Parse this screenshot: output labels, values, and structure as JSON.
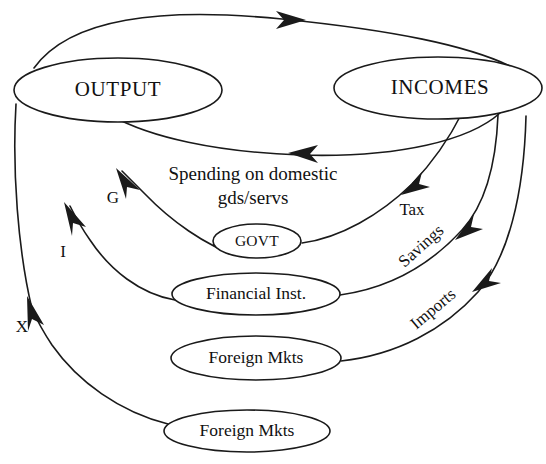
{
  "diagram": {
    "type": "circular-flow",
    "colors": {
      "stroke": "#1a1a1a",
      "text": "#111111",
      "background": "#ffffff"
    },
    "nodes": [
      {
        "id": "output",
        "label": "OUTPUT",
        "cx": 118,
        "cy": 90,
        "rx": 104,
        "ry": 32
      },
      {
        "id": "incomes",
        "label": "INCOMES",
        "cx": 438,
        "cy": 88,
        "rx": 104,
        "ry": 31
      },
      {
        "id": "govt",
        "label": "GOVT",
        "cx": 257,
        "cy": 241,
        "rx": 44,
        "ry": 17
      },
      {
        "id": "financial",
        "label": "Financial Inst.",
        "cx": 256,
        "cy": 294,
        "rx": 84,
        "ry": 21
      },
      {
        "id": "foreign1",
        "label": "Foreign Mkts",
        "cx": 256,
        "cy": 358,
        "rx": 85,
        "ry": 22
      },
      {
        "id": "foreign2",
        "label": "Foreign Mkts",
        "cx": 247,
        "cy": 431,
        "rx": 83,
        "ry": 21
      }
    ],
    "edges": [
      {
        "id": "output-to-incomes",
        "label": "",
        "from": "output",
        "to": "incomes"
      },
      {
        "id": "incomes-to-output",
        "label": "Spending on domestic gds/servs",
        "from": "incomes",
        "to": "output"
      },
      {
        "id": "incomes-to-govt",
        "label": "Tax",
        "from": "incomes",
        "to": "govt"
      },
      {
        "id": "incomes-to-financial",
        "label": "Savings",
        "from": "incomes",
        "to": "financial"
      },
      {
        "id": "incomes-to-foreign",
        "label": "Imports",
        "from": "incomes",
        "to": "foreign1"
      },
      {
        "id": "govt-to-output",
        "label": "G",
        "from": "govt",
        "to": "output"
      },
      {
        "id": "financial-to-output",
        "label": "I",
        "from": "financial",
        "to": "output"
      },
      {
        "id": "foreign-to-output",
        "label": "X",
        "from": "foreign2",
        "to": "output"
      }
    ],
    "labels": {
      "spending_line1": "Spending on domestic",
      "spending_line2": "gds/servs",
      "tax": "Tax",
      "savings": "Savings",
      "imports": "Imports",
      "g": "G",
      "i": "I",
      "x": "X"
    }
  }
}
